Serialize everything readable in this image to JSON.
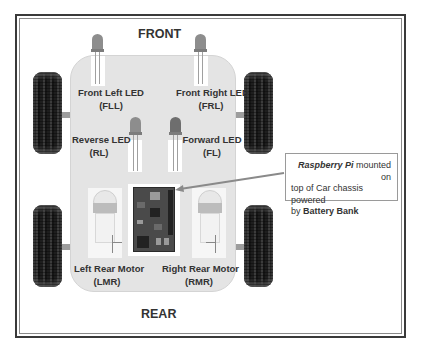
{
  "diagram": {
    "title_front": "FRONT",
    "title_rear": "REAR",
    "leds": [
      {
        "name": "Front Left LED",
        "abbr": "(FLL)"
      },
      {
        "name": "Front Right LED",
        "abbr": "(FRL)"
      },
      {
        "name": "Reverse LED",
        "abbr": "(RL)"
      },
      {
        "name": "Forward LED",
        "abbr": "(FL)"
      }
    ],
    "motors": [
      {
        "name": "Left Rear Motor",
        "abbr": "(LMR)"
      },
      {
        "name": "Right Rear Motor",
        "abbr": "(RMR)"
      }
    ],
    "callout": {
      "emphasis": "Raspberry Pi",
      "text_after_emphasis": " mounted on",
      "line2": "top of Car chassis powered",
      "line3_prefix": "by ",
      "line3_bold": "Battery Bank"
    },
    "colors": {
      "chassis": "#e4e4e4",
      "frame": "#3a3a3a",
      "wheel": "#1e1e1e",
      "led": "#8d8d8d",
      "arrow": "#8a8a8a"
    }
  }
}
